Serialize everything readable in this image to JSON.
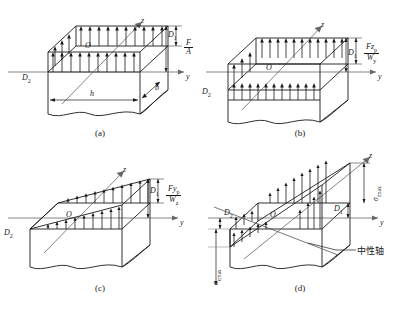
{
  "figure": {
    "line_color": "#1a1a1a",
    "axis_color": "#555555",
    "background": "#ffffff"
  },
  "panels": [
    {
      "id": "a",
      "caption": "(a)",
      "axis_z": "z",
      "axis_y": "y",
      "origin": "O",
      "corner_near": "D",
      "corner_near_sub": "1",
      "corner_far": "D",
      "corner_far_sub": "2",
      "dim_width": "h",
      "dim_depth": "b",
      "stress_numerator": "F",
      "stress_denominator": "A",
      "distribution": "uniform"
    },
    {
      "id": "b",
      "caption": "(b)",
      "axis_z": "z",
      "axis_y": "y",
      "origin": "O",
      "corner_near": "D",
      "corner_near_sub": "1",
      "corner_far": "D",
      "corner_far_sub": "2",
      "stress_numerator": "Fz",
      "stress_numerator_sub": "p",
      "stress_denominator": "W",
      "stress_denominator_sub": "y",
      "distribution": "uniform"
    },
    {
      "id": "c",
      "caption": "(c)",
      "axis_z": "z",
      "axis_y": "y",
      "origin": "O",
      "corner_near": "D",
      "corner_near_sub": "1",
      "corner_far": "D",
      "corner_far_sub": "2",
      "stress_numerator": "Fy",
      "stress_numerator_sub": "p",
      "stress_denominator": "W",
      "stress_denominator_sub": "z",
      "distribution": "linear"
    },
    {
      "id": "d",
      "caption": "(d)",
      "axis_z": "z",
      "axis_y": "y",
      "origin": "O",
      "corner_near": "D",
      "corner_near_sub": "1",
      "corner_far": "D",
      "corner_far_sub": "2",
      "sigma_tension": "σ",
      "sigma_tension_sub": "tmax",
      "sigma_compression": "σ",
      "sigma_compression_sub": "cmax",
      "neutral_axis_label": "中性轴",
      "distribution": "trapezoidal"
    }
  ]
}
